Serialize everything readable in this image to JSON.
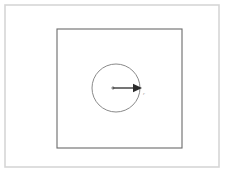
{
  "figure": {
    "title": "Circle inscribed in a square with radius arrow",
    "background_color": "#ffffff",
    "frame": {
      "name": "outer-frame",
      "stroke_color": "#d6d6d6",
      "stroke_width": 1.6,
      "x": 5,
      "y": 5,
      "width": 214,
      "height": 162
    },
    "square": {
      "name": "inner-square",
      "label": "",
      "stroke_color": "#6b6b6b",
      "fill": "none",
      "stroke_width": 1.1,
      "x": 57,
      "y": 29,
      "width": 125,
      "height": 119
    },
    "circle": {
      "name": "circle",
      "label": "",
      "stroke_color": "#8a8a8a",
      "fill": "none",
      "stroke_width": 1,
      "center_x": 116,
      "center_y": 88,
      "radius": 24
    },
    "radius_arrow": {
      "name": "radius-arrow",
      "label": "r",
      "stroke_color": "#2b2b2b",
      "label_color": "#9a9a9a",
      "stroke_width": 1.3,
      "start_x": 113,
      "start_y": 88,
      "end_x": 142,
      "end_y": 88,
      "head_length": 9,
      "head_half_width": 4.2,
      "label_x": 143,
      "label_y": 95,
      "label_size": 5
    },
    "center_dot": {
      "name": "circle-center-dot",
      "color": "#4a4a4a",
      "x": 113,
      "y": 88,
      "radius": 1.1
    }
  }
}
